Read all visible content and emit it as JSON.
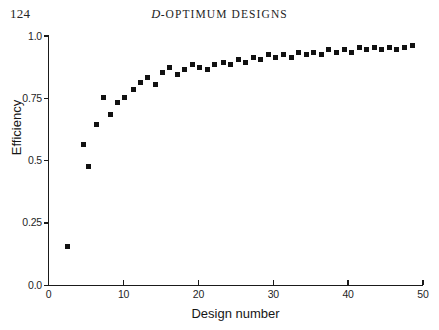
{
  "page": {
    "number": "124",
    "running_head_prefix": "D",
    "running_head_rest": "-OPTIMUM DESIGNS"
  },
  "chart_data": {
    "type": "scatter",
    "title": "",
    "xlabel": "Design number",
    "ylabel": "Efficiency",
    "xlim": [
      0,
      50
    ],
    "ylim": [
      0,
      1.0
    ],
    "grid": false,
    "legend": null,
    "marker": "filled-square",
    "marker_color": "#111111",
    "xticks": [
      0,
      10,
      20,
      30,
      40,
      50
    ],
    "xtick_labels": [
      "0",
      "10",
      "20",
      "30",
      "40",
      "50"
    ],
    "yticks": [
      0.0,
      0.25,
      0.5,
      0.75,
      1.0
    ],
    "ytick_labels": [
      "0.0",
      "0.25",
      "0.5",
      "0.75",
      "1.0"
    ],
    "x": [
      2.5,
      4.6,
      5.3,
      6.4,
      7.3,
      8.2,
      9.2,
      10.1,
      11.3,
      12.2,
      13.2,
      14.2,
      15.2,
      16.2,
      17.2,
      18.2,
      19.2,
      20.2,
      21.2,
      22.2,
      23.3,
      24.3,
      25.3,
      26.3,
      27.3,
      28.3,
      29.3,
      30.3,
      31.4,
      32.4,
      33.4,
      34.4,
      35.4,
      36.4,
      37.4,
      38.4,
      39.5,
      40.5,
      41.5,
      42.5,
      43.5,
      44.5,
      45.5,
      46.5,
      47.5,
      48.6
    ],
    "y": [
      0.155,
      0.565,
      0.475,
      0.645,
      0.755,
      0.685,
      0.735,
      0.755,
      0.785,
      0.815,
      0.835,
      0.805,
      0.855,
      0.875,
      0.845,
      0.865,
      0.885,
      0.875,
      0.865,
      0.885,
      0.895,
      0.885,
      0.905,
      0.895,
      0.915,
      0.905,
      0.925,
      0.915,
      0.925,
      0.915,
      0.935,
      0.925,
      0.935,
      0.925,
      0.945,
      0.935,
      0.945,
      0.935,
      0.955,
      0.945,
      0.955,
      0.945,
      0.955,
      0.945,
      0.955,
      0.96
    ]
  }
}
